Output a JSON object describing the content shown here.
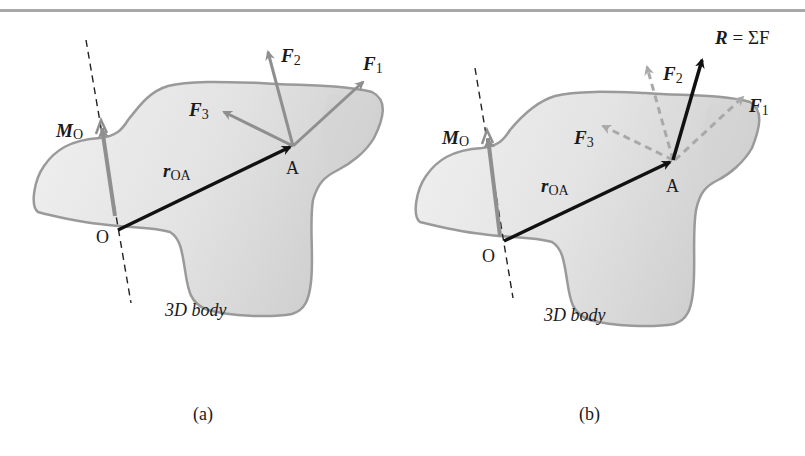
{
  "figure": {
    "panels": [
      {
        "id": "a",
        "caption": "(a)",
        "body_label": "3D body",
        "point_O": "O",
        "point_A": "A",
        "position_vector": {
          "main": "r",
          "sub": "OA"
        },
        "moment": {
          "main": "M",
          "sub": "O"
        },
        "forces": [
          {
            "main": "F",
            "sub": "1"
          },
          {
            "main": "F",
            "sub": "2"
          },
          {
            "main": "F",
            "sub": "3"
          }
        ]
      },
      {
        "id": "b",
        "caption": "(b)",
        "body_label": "3D body",
        "point_O": "O",
        "point_A": "A",
        "position_vector": {
          "main": "r",
          "sub": "OA"
        },
        "moment": {
          "main": "M",
          "sub": "O"
        },
        "forces": [
          {
            "main": "F",
            "sub": "1"
          },
          {
            "main": "F",
            "sub": "2"
          },
          {
            "main": "F",
            "sub": "3"
          }
        ],
        "resultant": {
          "R": "R",
          "eq": " = ΣF"
        }
      }
    ],
    "colors": {
      "body_fill": "#e6e6e6",
      "body_shade": "#d2d2d2",
      "body_outline": "#9a9a9a",
      "force_gray": "#8f8f8f",
      "vector_black": "#111111"
    }
  }
}
